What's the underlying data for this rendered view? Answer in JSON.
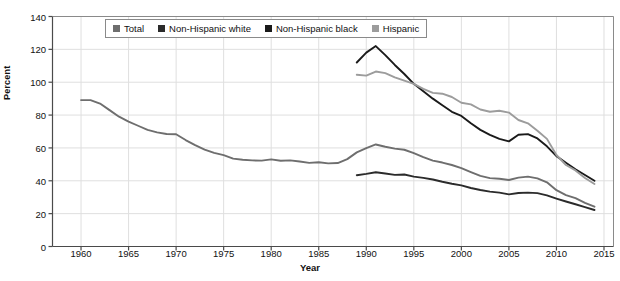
{
  "chart_data": {
    "type": "line",
    "title": "",
    "xlabel": "Year",
    "ylabel": "Percent",
    "xlim": [
      1957,
      2016
    ],
    "ylim": [
      0,
      140
    ],
    "ytick_step": 20,
    "grid": true,
    "legend_position": "top-center",
    "xticks": [
      "1960",
      "1965",
      "1970",
      "1975",
      "1980",
      "1985",
      "1990",
      "1995",
      "2000",
      "2005",
      "2010",
      "2015"
    ],
    "yticks": [
      "0",
      "20",
      "40",
      "60",
      "80",
      "100",
      "120",
      "140"
    ],
    "series": [
      {
        "name": "Total",
        "color": "#6e6e6e",
        "x": [
          1960,
          1961,
          1962,
          1963,
          1964,
          1965,
          1966,
          1967,
          1968,
          1969,
          1970,
          1971,
          1972,
          1973,
          1974,
          1975,
          1976,
          1977,
          1978,
          1979,
          1980,
          1981,
          1982,
          1983,
          1984,
          1985,
          1986,
          1987,
          1988,
          1989,
          1990,
          1991,
          1992,
          1993,
          1994,
          1995,
          1996,
          1997,
          1998,
          1999,
          2000,
          2001,
          2002,
          2003,
          2004,
          2005,
          2006,
          2007,
          2008,
          2009,
          2010,
          2011,
          2012,
          2013,
          2014
        ],
        "values": [
          89.1,
          89.1,
          87.0,
          83.0,
          79.0,
          76.0,
          73.5,
          71.0,
          69.5,
          68.5,
          68.3,
          64.8,
          61.7,
          59.0,
          57.0,
          55.6,
          53.5,
          52.8,
          52.4,
          52.3,
          53.0,
          52.2,
          52.4,
          51.7,
          50.9,
          51.3,
          50.6,
          50.8,
          53.2,
          57.3,
          59.9,
          62.1,
          60.7,
          59.6,
          58.9,
          56.8,
          54.4,
          52.3,
          51.1,
          49.6,
          47.7,
          45.3,
          43.0,
          41.6,
          41.2,
          40.5,
          41.9,
          42.5,
          41.5,
          39.1,
          34.3,
          31.3,
          29.4,
          26.5,
          24.2
        ]
      },
      {
        "name": "Non-Hispanic white",
        "color": "#2b2b2b",
        "x": [
          1989,
          1990,
          1991,
          1992,
          1993,
          1994,
          1995,
          1996,
          1997,
          1998,
          1999,
          2000,
          2001,
          2002,
          2003,
          2004,
          2005,
          2006,
          2007,
          2008,
          2009,
          2010,
          2011,
          2012,
          2013,
          2014
        ],
        "values": [
          43.4,
          44.2,
          45.2,
          44.4,
          43.6,
          43.8,
          42.5,
          41.8,
          40.8,
          39.4,
          38.2,
          37.2,
          35.6,
          34.4,
          33.4,
          32.8,
          31.7,
          32.6,
          32.8,
          32.5,
          31.1,
          29.2,
          27.4,
          25.7,
          24.0,
          22.2
        ]
      },
      {
        "name": "Non-Hispanic black",
        "color": "#1a1a1a",
        "x": [
          1989,
          1990,
          1991,
          1992,
          1993,
          1994,
          1995,
          1996,
          1997,
          1998,
          1999,
          2000,
          2001,
          2002,
          2003,
          2004,
          2005,
          2006,
          2007,
          2008,
          2009,
          2010,
          2011,
          2012,
          2013,
          2014
        ],
        "values": [
          112.0,
          118.0,
          122.0,
          116.5,
          110.5,
          105.0,
          99.0,
          94.5,
          90.0,
          86.0,
          82.0,
          79.5,
          75.0,
          71.0,
          68.0,
          65.5,
          64.0,
          68.0,
          68.4,
          65.8,
          61.0,
          55.0,
          51.0,
          47.0,
          43.5,
          40.0
        ]
      },
      {
        "name": "Hispanic",
        "color": "#9c9c9c",
        "x": [
          1989,
          1990,
          1991,
          1992,
          1993,
          1994,
          1995,
          1996,
          1997,
          1998,
          1999,
          2000,
          2001,
          2002,
          2003,
          2004,
          2005,
          2006,
          2007,
          2008,
          2009,
          2010,
          2011,
          2012,
          2013,
          2014
        ],
        "values": [
          104.5,
          104.0,
          106.5,
          105.5,
          103.0,
          101.0,
          99.0,
          96.0,
          93.5,
          93.0,
          91.0,
          87.5,
          86.5,
          83.4,
          82.0,
          82.6,
          81.5,
          77.0,
          75.0,
          70.5,
          65.5,
          55.7,
          49.6,
          46.3,
          41.7,
          38.0
        ]
      }
    ]
  },
  "legend": {
    "items": [
      {
        "label": "Total",
        "color": "#6e6e6e"
      },
      {
        "label": "Non-Hispanic white",
        "color": "#2b2b2b"
      },
      {
        "label": "Non-Hispanic black",
        "color": "#1a1a1a"
      },
      {
        "label": "Hispanic",
        "color": "#9c9c9c"
      }
    ]
  }
}
